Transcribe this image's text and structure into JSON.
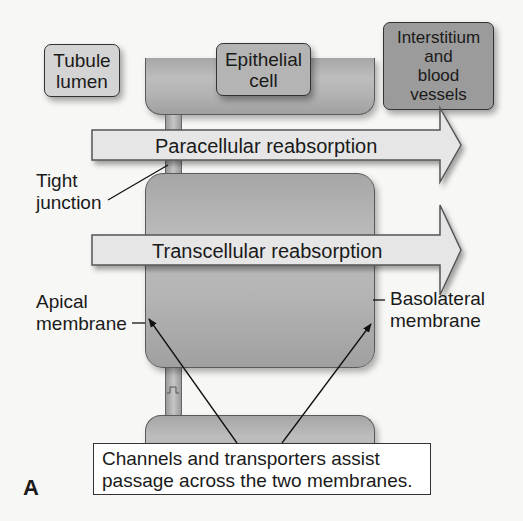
{
  "figure": {
    "panel_letter": "A",
    "colors": {
      "background": "#f7f7f5",
      "cell_fill": "#b3b3b3",
      "arrow_fill": "#e6e6e6",
      "tubule_box": "#d4d4d4",
      "epithelial_box": "#b4b4b4",
      "interstitium_box": "#9b9b9b",
      "outline": "#333333"
    }
  },
  "compartments": {
    "tubule_lumen": "Tubule\nlumen",
    "epithelial_cell": "Epithelial\ncell",
    "interstitium": "Interstitium\nand\nblood\nvessels"
  },
  "pathways": {
    "paracellular": "Paracellular reabsorption",
    "transcellular": "Transcellular reabsorption"
  },
  "annotations": {
    "tight_junction": "Tight\njunction",
    "apical_membrane": "Apical\nmembrane",
    "basolateral_membrane": "Basolateral\nmembrane",
    "callout": "Channels and transporters assist\npassage across the two membranes."
  }
}
